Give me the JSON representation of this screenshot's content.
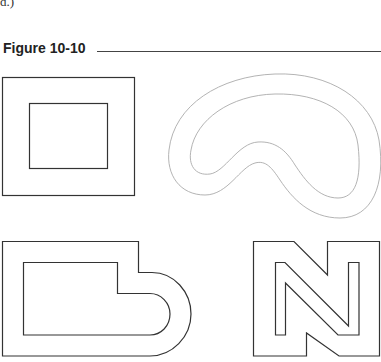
{
  "header": {
    "fragment_text": "d.)",
    "figure_title": "Figure 10-10"
  },
  "figure": {
    "shapes": [
      {
        "id": "square-frame",
        "stroke": "#333333"
      },
      {
        "id": "kidney-band",
        "stroke": "#aaaaaa"
      },
      {
        "id": "b-shape-frame",
        "stroke": "#333333"
      },
      {
        "id": "n-letter-outline",
        "stroke": "#333333"
      }
    ]
  }
}
